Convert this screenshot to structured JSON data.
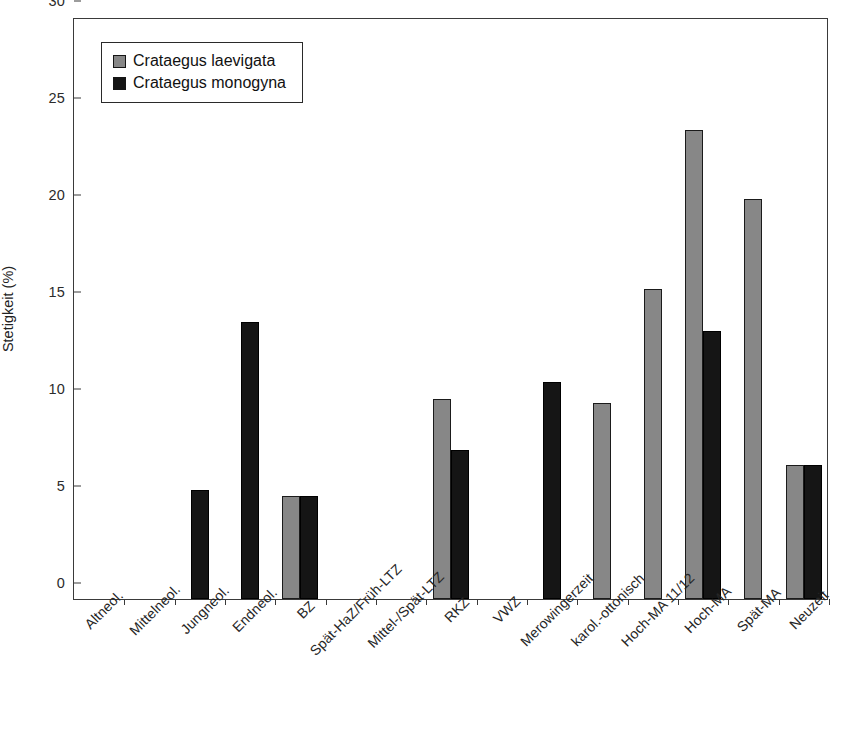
{
  "chart_data": {
    "type": "bar",
    "title": "",
    "xlabel": "",
    "ylabel": "Stetigkeit (%)",
    "ylim": [
      0,
      30
    ],
    "yticks": [
      0,
      5,
      10,
      15,
      20,
      25,
      30
    ],
    "grid": false,
    "legend_position": "top-left",
    "categories": [
      "Altneol.",
      "Mittelneol.",
      "Jungneol.",
      "Endneol.",
      "BZ",
      "Spät-HaZ/Früh-LTZ",
      "Mittel-/Spät-LTZ",
      "RKZ",
      "VWZ",
      "Merowingerzeit",
      "karol.-ottonisch",
      "Hoch-MA 11/12",
      "Hoch-MA",
      "Spät-MA",
      "Neuzeit"
    ],
    "series": [
      {
        "name": "Crataegus laevigata",
        "color": "#878787",
        "values": [
          0,
          0,
          0,
          0,
          5.3,
          0,
          0,
          10.3,
          0,
          0,
          10.1,
          16.0,
          24.2,
          20.6,
          6.9
        ]
      },
      {
        "name": "Crataegus monogyna",
        "color": "#151515",
        "values": [
          0,
          0,
          5.6,
          14.3,
          5.3,
          0,
          0,
          7.7,
          0,
          11.2,
          0,
          0,
          13.8,
          0,
          6.9
        ]
      }
    ]
  },
  "legend": {
    "items": [
      {
        "label": "Crataegus laevigata",
        "swatch": "laevigata"
      },
      {
        "label": "Crataegus monogyna",
        "swatch": "monogyna"
      }
    ]
  }
}
